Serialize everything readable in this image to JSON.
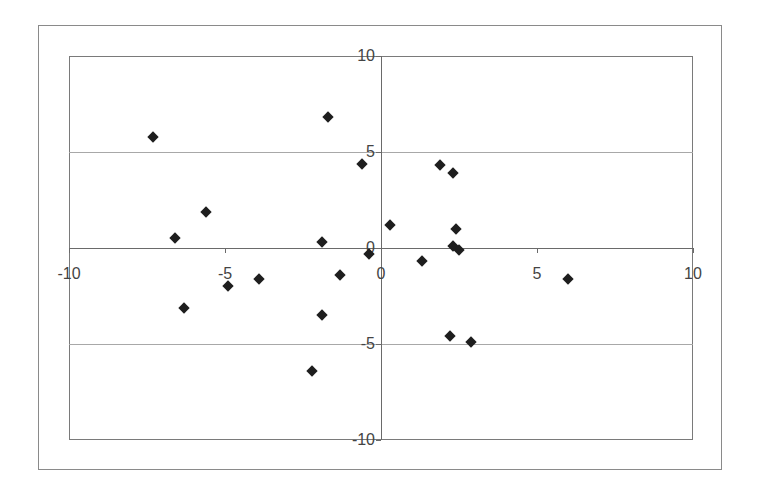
{
  "chart_data": {
    "type": "scatter",
    "title": "",
    "xlabel": "",
    "ylabel": "",
    "xlim": [
      -10,
      10
    ],
    "ylim": [
      -10,
      10
    ],
    "x_ticks": [
      "-10",
      "-5",
      "0",
      "5",
      "10"
    ],
    "y_ticks": [
      "10",
      "5",
      "0",
      "-5",
      "-10"
    ],
    "grid": "horizontal major gridlines at 5 and -5",
    "legend": "none",
    "marker": "diamond",
    "series": [
      {
        "name": "Series 1",
        "points": [
          {
            "x": -7.3,
            "y": 5.8
          },
          {
            "x": -1.7,
            "y": 6.8
          },
          {
            "x": -0.6,
            "y": 4.4
          },
          {
            "x": -5.6,
            "y": 1.9
          },
          {
            "x": -6.6,
            "y": 0.5
          },
          {
            "x": -1.9,
            "y": 0.3
          },
          {
            "x": -0.4,
            "y": -0.3
          },
          {
            "x": -1.3,
            "y": -1.4
          },
          {
            "x": -3.9,
            "y": -1.6
          },
          {
            "x": -4.9,
            "y": -2.0
          },
          {
            "x": -6.3,
            "y": -3.1
          },
          {
            "x": -1.9,
            "y": -3.5
          },
          {
            "x": -2.2,
            "y": -6.4
          },
          {
            "x": 0.3,
            "y": 1.2
          },
          {
            "x": 1.9,
            "y": 4.3
          },
          {
            "x": 2.3,
            "y": 3.9
          },
          {
            "x": 2.4,
            "y": 1.0
          },
          {
            "x": 2.3,
            "y": 0.1
          },
          {
            "x": 2.5,
            "y": -0.1
          },
          {
            "x": 1.3,
            "y": -0.7
          },
          {
            "x": 6.0,
            "y": -1.6
          },
          {
            "x": 2.2,
            "y": -4.6
          },
          {
            "x": 2.9,
            "y": -4.9
          }
        ]
      }
    ]
  },
  "colors": {
    "marker": "#1e1e1e",
    "axis": "#6a6a6a",
    "grid": "#a8a8a8",
    "background": "#ffffff"
  }
}
